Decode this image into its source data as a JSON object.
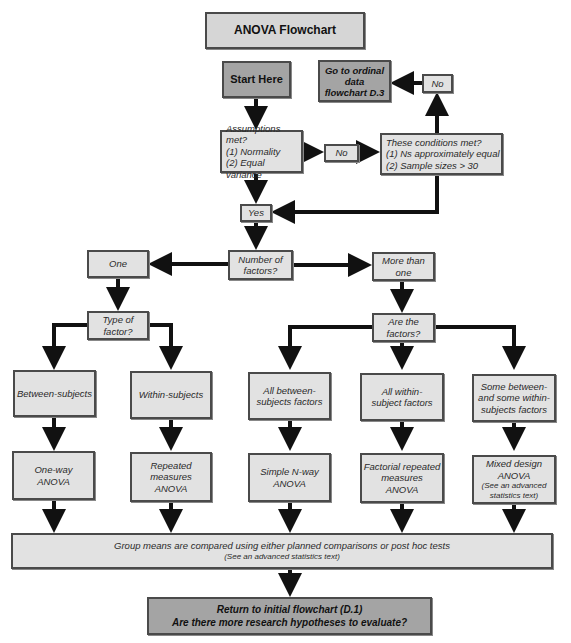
{
  "title": "ANOVA Flowchart",
  "nodes": {
    "start": "Start Here",
    "ordinal": [
      "Go to ordinal",
      "data",
      "flowchart D.3"
    ],
    "no_top": "No",
    "assumptions": [
      "Assumptions met?",
      "(1) Normality",
      "(2) Equal variance"
    ],
    "no_mid": "No",
    "conditions": [
      "These conditions met?",
      "(1) Ns approximately equal",
      "(2) Sample sizes > 30"
    ],
    "yes": "Yes",
    "num_factors": [
      "Number of",
      "factors?"
    ],
    "one": "One",
    "more_than_one": [
      "More than",
      "one"
    ],
    "type_of_factor": [
      "Type of",
      "factor?"
    ],
    "are_the_factors": [
      "Are the",
      "factors?"
    ],
    "between": "Between-subjects",
    "within": "Within-subjects",
    "all_between": [
      "All between-",
      "subjects factors"
    ],
    "all_within": [
      "All within-",
      "subject factors"
    ],
    "some_mixed": [
      "Some between-",
      "and some within-",
      "subjects factors"
    ],
    "oneway": [
      "One-way",
      "ANOVA"
    ],
    "repeated": [
      "Repeated",
      "measures",
      "ANOVA"
    ],
    "simple_nway": [
      "Simple N-way",
      "ANOVA"
    ],
    "factorial_repeated": [
      "Factorial repeated",
      "measures",
      "ANOVA"
    ],
    "mixed": [
      "Mixed design",
      "ANOVA"
    ],
    "mixed_note": [
      "(See an advanced",
      "statistics text)"
    ],
    "group_means": "Group means are compared using either planned comparisons or post hoc tests",
    "group_means_note": "(See an advanced statistics text)",
    "return": [
      "Return to initial flowchart (D.1)",
      "Are there more research hypotheses to evaluate?"
    ]
  },
  "colors": {
    "box_light": "#e2e2e2",
    "box_dark": "#a4a4a4",
    "border": "#4a4a4a",
    "arrow": "#111111"
  }
}
